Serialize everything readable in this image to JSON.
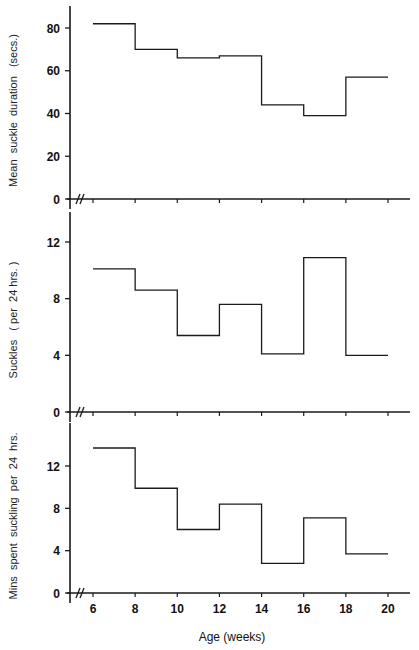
{
  "chart_data": [
    {
      "type": "line",
      "step": true,
      "title": "",
      "xlabel": "Age (weeks)",
      "ylabel": "Mean suckle duration (secs.)",
      "x_edges": [
        6,
        8,
        10,
        12,
        14,
        16,
        18,
        20
      ],
      "values": [
        82,
        70,
        66,
        67,
        44,
        39,
        57
      ],
      "yticks": [
        0,
        20,
        40,
        60,
        80
      ],
      "ylim": [
        0,
        90
      ],
      "xlim": [
        5,
        21
      ],
      "grid": false
    },
    {
      "type": "line",
      "step": true,
      "title": "",
      "xlabel": "Age (weeks)",
      "ylabel": "Suckles (per 24 hrs.)",
      "x_edges": [
        6,
        8,
        10,
        12,
        14,
        16,
        18,
        20
      ],
      "values": [
        10.1,
        8.6,
        5.4,
        7.6,
        4.1,
        10.9,
        4.0
      ],
      "yticks": [
        0,
        4,
        8,
        12
      ],
      "ylim": [
        0,
        14
      ],
      "xlim": [
        5,
        21
      ],
      "grid": false
    },
    {
      "type": "line",
      "step": true,
      "title": "",
      "xlabel": "Age (weeks)",
      "ylabel": "Mins spent suckling per 24 hrs.",
      "x_edges": [
        6,
        8,
        10,
        12,
        14,
        16,
        18,
        20
      ],
      "values": [
        13.7,
        9.9,
        6.0,
        8.4,
        2.8,
        7.1,
        3.7
      ],
      "yticks": [
        0,
        4,
        8,
        12
      ],
      "ylim": [
        0,
        15
      ],
      "xlim": [
        5,
        21
      ],
      "grid": false
    }
  ],
  "axes": {
    "xlabel": "Age (weeks)",
    "xticks": [
      "6",
      "8",
      "10",
      "12",
      "14",
      "16",
      "18",
      "20"
    ],
    "axis_break_marker": "//"
  },
  "panels": [
    {
      "ylabel": "Mean  suckle  duration   (secs.)",
      "yticks": [
        "0",
        "20",
        "40",
        "60",
        "80"
      ]
    },
    {
      "ylabel": "Suckles   ( per  24 hrs. )",
      "yticks": [
        "0",
        "4",
        "8",
        "12"
      ]
    },
    {
      "ylabel": "Mins  spent  suckling  per  24  hrs.",
      "yticks": [
        "0",
        "4",
        "8",
        "12"
      ]
    }
  ],
  "colors": {
    "line": "#1a1a1a",
    "background": "#ffffff"
  }
}
